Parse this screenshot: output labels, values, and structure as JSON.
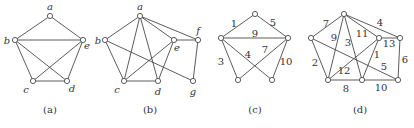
{
  "graphs": [
    {
      "caption": "(a)",
      "caption_pos": [
        50,
        113
      ],
      "vertices": [
        {
          "id": "a",
          "x": 50,
          "y": 16,
          "lx": 50,
          "ly": 10
        },
        {
          "id": "b",
          "x": 15,
          "y": 40,
          "lx": 7,
          "ly": 44
        },
        {
          "id": "e",
          "x": 83,
          "y": 40,
          "lx": 87,
          "ly": 49
        },
        {
          "id": "c",
          "x": 33,
          "y": 81,
          "lx": 26,
          "ly": 93
        },
        {
          "id": "d",
          "x": 67,
          "y": 81,
          "lx": 72,
          "ly": 92
        }
      ],
      "edges": [
        [
          "a",
          "b"
        ],
        [
          "a",
          "e"
        ],
        [
          "b",
          "e"
        ],
        [
          "b",
          "c"
        ],
        [
          "b",
          "d"
        ],
        [
          "c",
          "d"
        ],
        [
          "c",
          "e"
        ],
        [
          "e",
          "d"
        ]
      ]
    },
    {
      "caption": "(b)",
      "caption_pos": [
        150,
        113
      ],
      "vertices": [
        {
          "id": "a",
          "x": 140,
          "y": 16,
          "lx": 140,
          "ly": 10
        },
        {
          "id": "b",
          "x": 105,
          "y": 40,
          "lx": 98,
          "ly": 44
        },
        {
          "id": "e",
          "x": 174,
          "y": 40,
          "lx": 177,
          "ly": 51
        },
        {
          "id": "f",
          "x": 198,
          "y": 40,
          "lx": 198,
          "ly": 34
        },
        {
          "id": "c",
          "x": 124,
          "y": 81,
          "lx": 117,
          "ly": 93
        },
        {
          "id": "d",
          "x": 158,
          "y": 81,
          "lx": 158,
          "ly": 95
        },
        {
          "id": "g",
          "x": 193,
          "y": 81,
          "lx": 193,
          "ly": 95
        }
      ],
      "edges": [
        [
          "a",
          "b"
        ],
        [
          "a",
          "c"
        ],
        [
          "a",
          "d"
        ],
        [
          "a",
          "e"
        ],
        [
          "a",
          "f"
        ],
        [
          "b",
          "c"
        ],
        [
          "b",
          "g"
        ],
        [
          "c",
          "d"
        ],
        [
          "c",
          "e"
        ],
        [
          "d",
          "e"
        ],
        [
          "e",
          "f"
        ],
        [
          "f",
          "g"
        ]
      ]
    },
    {
      "caption": "(c)",
      "caption_pos": [
        255,
        113
      ],
      "vertices": [
        {
          "id": "t",
          "x": 255,
          "y": 14
        },
        {
          "id": "l",
          "x": 221,
          "y": 38
        },
        {
          "id": "r",
          "x": 288,
          "y": 38
        },
        {
          "id": "bl",
          "x": 238,
          "y": 80
        },
        {
          "id": "br",
          "x": 272,
          "y": 80
        }
      ],
      "edges": [
        {
          "from": "t",
          "to": "l",
          "label": "1",
          "lx": 234,
          "ly": 27
        },
        {
          "from": "t",
          "to": "r",
          "label": "5",
          "lx": 273,
          "ly": 26
        },
        {
          "from": "l",
          "to": "r",
          "label": "9",
          "lx": 255,
          "ly": 37
        },
        {
          "from": "l",
          "to": "bl",
          "label": "3",
          "lx": 221,
          "ly": 65
        },
        {
          "from": "l",
          "to": "br",
          "label": "4",
          "lx": 248,
          "ly": 58
        },
        {
          "from": "r",
          "to": "bl",
          "label": "7",
          "lx": 265,
          "ly": 53
        },
        {
          "from": "r",
          "to": "br",
          "label": "10",
          "lx": 286,
          "ly": 65
        }
      ]
    },
    {
      "caption": "(d)",
      "caption_pos": [
        360,
        113
      ],
      "vertices": [
        {
          "id": "t",
          "x": 344,
          "y": 14
        },
        {
          "id": "l",
          "x": 311,
          "y": 38
        },
        {
          "id": "r",
          "x": 379,
          "y": 38
        },
        {
          "id": "rr",
          "x": 400,
          "y": 38
        },
        {
          "id": "bl",
          "x": 328,
          "y": 80
        },
        {
          "id": "bm",
          "x": 362,
          "y": 80
        },
        {
          "id": "br",
          "x": 398,
          "y": 80
        }
      ],
      "edges": [
        {
          "from": "t",
          "to": "l",
          "label": "7",
          "lx": 326,
          "ly": 27
        },
        {
          "from": "t",
          "to": "rr",
          "label": "4",
          "lx": 380,
          "ly": 26
        },
        {
          "from": "t",
          "to": "bl",
          "label": "9",
          "lx": 334,
          "ly": 41
        },
        {
          "from": "t",
          "to": "bm",
          "label": "3",
          "lx": 348,
          "ly": 46
        },
        {
          "from": "t",
          "to": "r",
          "label": "11",
          "lx": 362,
          "ly": 37
        },
        {
          "from": "r",
          "to": "rr",
          "label": "13",
          "lx": 389,
          "ly": 47
        },
        {
          "from": "l",
          "to": "bl",
          "label": "2",
          "lx": 315,
          "ly": 66
        },
        {
          "from": "l",
          "to": "br",
          "label": "5",
          "lx": 384,
          "ly": 70
        },
        {
          "from": "bl",
          "to": "r",
          "label": "12",
          "lx": 344,
          "ly": 74
        },
        {
          "from": "r",
          "to": "bm",
          "label": "1",
          "lx": 377,
          "ly": 58
        },
        {
          "from": "rr",
          "to": "br",
          "label": "6",
          "lx": 405,
          "ly": 63
        },
        {
          "from": "bl",
          "to": "bm",
          "label": "8",
          "lx": 346,
          "ly": 92
        },
        {
          "from": "bm",
          "to": "br",
          "label": "10",
          "lx": 381,
          "ly": 91
        }
      ]
    }
  ]
}
